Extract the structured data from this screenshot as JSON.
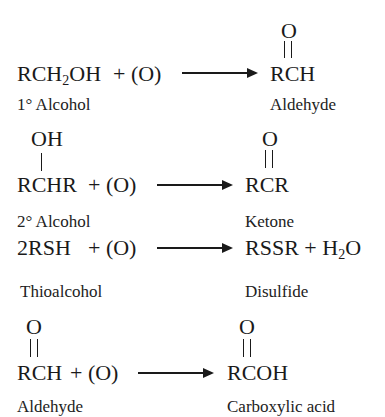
{
  "reactions": [
    {
      "reactant": {
        "main": "RCH",
        "sub": "2",
        "tail": "OH"
      },
      "oxidant": "+ (O)",
      "product": "RCH",
      "product_substituent": "O",
      "reactant_label": "1° Alcohol",
      "product_label": "Aldehyde"
    },
    {
      "reactant": "RCHR",
      "reactant_substituent": "OH",
      "oxidant": "+ (O)",
      "product": "RCR",
      "product_substituent": "O",
      "reactant_label": "2° Alcohol",
      "product_label": "Ketone"
    },
    {
      "reactant": "2RSH",
      "oxidant": "+ (O)",
      "product": {
        "main": "RSSR + H",
        "sub": "2",
        "tail": "O"
      },
      "reactant_label": "Thioalcohol",
      "product_label": "Disulfide"
    },
    {
      "reactant": "RCH",
      "reactant_substituent": "O",
      "oxidant": "+ (O)",
      "product": "RCOH",
      "product_substituent": "O",
      "reactant_label": "Aldehyde",
      "product_label": "Carboxylic acid"
    }
  ]
}
